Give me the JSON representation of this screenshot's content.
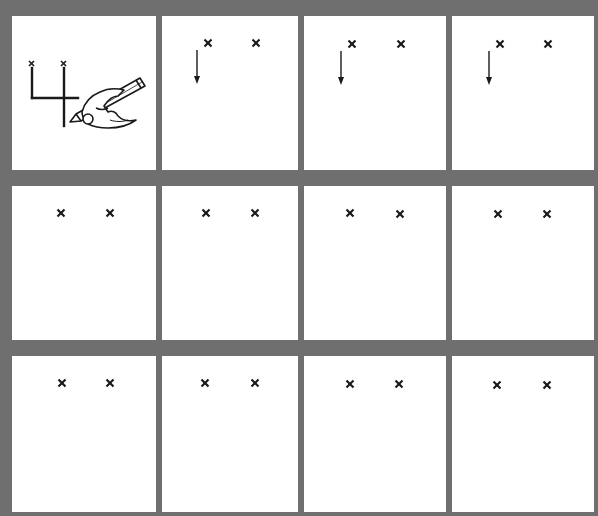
{
  "worksheet": {
    "title": "Trace the number 4",
    "digit": "4",
    "colors": {
      "background": "#6f6f6f",
      "cell": "#ffffff",
      "ink": "#1a1a1a"
    },
    "grid": {
      "rows": 3,
      "columns": 4
    },
    "example_cell": {
      "description": "Hand holding pencil writing the digit 4 between two start marks",
      "start_marks": 2
    },
    "cells": [
      {
        "row": 1,
        "col": 1,
        "type": "example",
        "marks": 2,
        "arrow": false
      },
      {
        "row": 1,
        "col": 2,
        "type": "practice",
        "marks": 2,
        "arrow": true,
        "arrow_direction": "down"
      },
      {
        "row": 1,
        "col": 3,
        "type": "practice",
        "marks": 2,
        "arrow": true,
        "arrow_direction": "down"
      },
      {
        "row": 1,
        "col": 4,
        "type": "practice",
        "marks": 2,
        "arrow": true,
        "arrow_direction": "down"
      },
      {
        "row": 2,
        "col": 1,
        "type": "practice",
        "marks": 2,
        "arrow": false
      },
      {
        "row": 2,
        "col": 2,
        "type": "practice",
        "marks": 2,
        "arrow": false
      },
      {
        "row": 2,
        "col": 3,
        "type": "practice",
        "marks": 2,
        "arrow": false
      },
      {
        "row": 2,
        "col": 4,
        "type": "practice",
        "marks": 2,
        "arrow": false
      },
      {
        "row": 3,
        "col": 1,
        "type": "practice",
        "marks": 2,
        "arrow": false
      },
      {
        "row": 3,
        "col": 2,
        "type": "practice",
        "marks": 2,
        "arrow": false
      },
      {
        "row": 3,
        "col": 3,
        "type": "practice",
        "marks": 2,
        "arrow": false
      },
      {
        "row": 3,
        "col": 4,
        "type": "practice",
        "marks": 2,
        "arrow": false
      }
    ],
    "mark_icon": "x-mark-icon",
    "arrow_icon": "arrow-down-icon",
    "hand_icon": "hand-pencil-icon"
  }
}
